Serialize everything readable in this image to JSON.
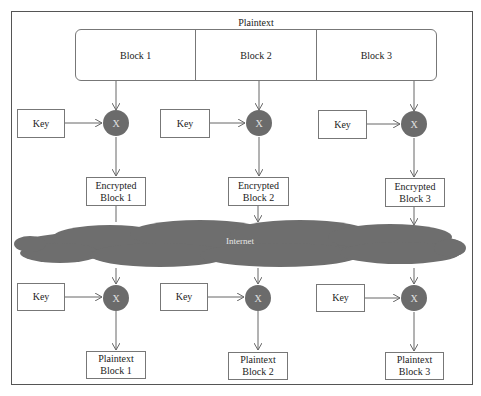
{
  "diagram": {
    "title": "Plaintext",
    "plaintext_blocks": [
      "Block 1",
      "Block 2",
      "Block 3"
    ],
    "operator_symbol": "X",
    "key_label": "Key",
    "network_label": "Internet",
    "encrypted_blocks": [
      {
        "line1": "Encrypted",
        "line2": "Block 1"
      },
      {
        "line1": "Encrypted",
        "line2": "Block 2"
      },
      {
        "line1": "Encrypted",
        "line2": "Block 3"
      }
    ],
    "decrypted_blocks": [
      {
        "line1": "Plaintext",
        "line2": "Block 1"
      },
      {
        "line1": "Plaintext",
        "line2": "Block 2"
      },
      {
        "line1": "Plaintext",
        "line2": "Block 3"
      }
    ],
    "colors": {
      "node_fill": "#6b6b6b",
      "cloud_fill": "#6e6e6e",
      "line": "#666666",
      "frame": "#555555"
    }
  }
}
